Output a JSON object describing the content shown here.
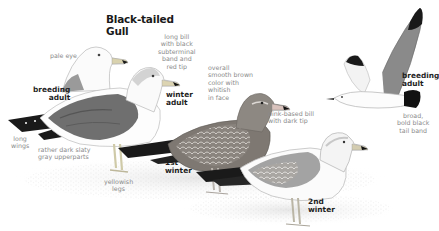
{
  "plate": {
    "title": "Black-tailed\nGull",
    "title_line1": "Black-tailed",
    "title_line2": "Gull"
  },
  "birds": [
    {
      "id": "breeding-adult-standing",
      "label": "breeding\nadult",
      "notes": [
        "pale eye"
      ]
    },
    {
      "id": "winter-adult",
      "label": "winter\nadult",
      "notes": [
        "long bill\nwith black\nsubterminal\nband and\nred tip",
        "long\nwings",
        "rather dark slaty\ngray upperparts",
        "yellowish\nlegs"
      ]
    },
    {
      "id": "first-winter",
      "label": "1st\nwinter",
      "notes": [
        "overall\nsmooth brown\ncolor with\nwhitish\nin face",
        "pink-based bill\nwith dark tip"
      ]
    },
    {
      "id": "second-winter",
      "label": "2nd\nwinter",
      "notes": []
    },
    {
      "id": "breeding-adult-flight",
      "label": "breeding\nadult",
      "notes": [
        "broad,\nbold black\ntail band"
      ]
    }
  ],
  "colors": {
    "label_text": "#1e1e1e",
    "note_text": "#8a8a8a",
    "mantle_gray": "#6f6f6f",
    "wingtip_black": "#1a1a1a",
    "juvenile_brown": "#7a7570",
    "bill_yellow": "#d8d0b0",
    "ground": "#eeeeee"
  }
}
